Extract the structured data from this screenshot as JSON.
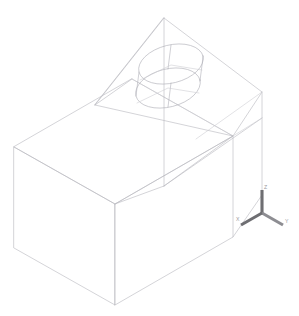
{
  "viewport": {
    "name": "cad-3d-viewport",
    "background_color": "#ffffff",
    "width": 299,
    "height": 316
  },
  "model": {
    "name": "wireframe-solid",
    "description": "Isometric wireframe of a rectangular prism with an inclined chamfer face and a cylindrical boss",
    "line_color": "#b9b9bf",
    "cylinder_color": "#b0b0b8",
    "projection": "isometric"
  },
  "axis_triad": {
    "name": "axis-triad",
    "origin": [
      262,
      213
    ],
    "axes": [
      {
        "label": "Z",
        "color": "#6e6e72",
        "label_pos": [
          264,
          187
        ]
      },
      {
        "label": "Y",
        "color": "#8d8d92",
        "label_pos": [
          285,
          221
        ]
      },
      {
        "label": "X",
        "color": "#6e6e72",
        "label_pos": [
          240,
          219
        ]
      }
    ]
  },
  "geometry": {
    "box_front_top_left": [
      14,
      147
    ],
    "box_front_top_mid": [
      115,
      204
    ],
    "box_bottom_left": [
      14,
      248
    ],
    "box_bottom_mid": [
      115,
      305
    ],
    "apex_top": [
      164,
      18
    ],
    "right_edge_top": [
      262,
      92
    ],
    "right_edge_bottom": [
      262,
      195
    ],
    "cylinder_center_top": [
      171,
      65
    ],
    "cylinder_center_bottom": [
      171,
      88
    ],
    "cylinder_rx": 33,
    "cylinder_ry": 19
  }
}
